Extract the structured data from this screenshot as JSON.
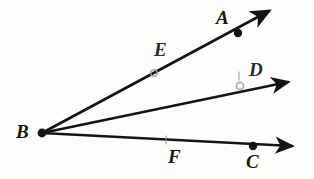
{
  "figure": {
    "type": "geometry-diagram",
    "background_color": "#fdfdfb",
    "ink_color": "#141414",
    "faded_ink_color": "#9a9a9a",
    "width": 314,
    "height": 179,
    "vertex": {
      "name": "B",
      "x": 42,
      "y": 133
    },
    "rays": [
      {
        "name": "ray-BA",
        "from": "B",
        "through": "A",
        "start": {
          "x": 42,
          "y": 133
        },
        "tip": {
          "x": 269,
          "y": 11
        },
        "stroke_width": 2.6
      },
      {
        "name": "ray-BD",
        "from": "B",
        "through": "D",
        "start": {
          "x": 42,
          "y": 133
        },
        "tip": {
          "x": 288,
          "y": 82
        },
        "stroke_width": 2.4
      },
      {
        "name": "ray-BC",
        "from": "B",
        "through": "C",
        "start": {
          "x": 42,
          "y": 133
        },
        "tip": {
          "x": 292,
          "y": 146
        },
        "stroke_width": 2.4
      }
    ],
    "points": [
      {
        "name": "A",
        "label": "A",
        "dot_x": 238,
        "dot_y": 33,
        "dot_r": 4.2,
        "dot_style": "solid",
        "label_x": 216,
        "label_y": 8
      },
      {
        "name": "B",
        "label": "B",
        "dot_x": 42,
        "dot_y": 133,
        "dot_r": 4.4,
        "dot_style": "solid",
        "label_x": 16,
        "label_y": 122
      },
      {
        "name": "C",
        "label": "C",
        "dot_x": 253,
        "dot_y": 146,
        "dot_r": 4.2,
        "dot_style": "solid",
        "label_x": 246,
        "label_y": 152
      },
      {
        "name": "D",
        "label": "D",
        "dot_x": 240,
        "dot_y": 86,
        "dot_r": 3.6,
        "dot_style": "faded",
        "label_x": 249,
        "label_y": 60
      },
      {
        "name": "E",
        "label": "E",
        "dot_x": 154,
        "dot_y": 73,
        "dot_r": 3.2,
        "dot_style": "faded",
        "label_x": 154,
        "label_y": 40
      },
      {
        "name": "F",
        "label": "F",
        "dot_x": 166,
        "dot_y": 140,
        "dot_r": 0,
        "dot_style": "tick",
        "label_x": 168,
        "label_y": 147
      }
    ],
    "tick_marks": [
      {
        "name": "tick-at-F",
        "x": 166,
        "y": 140,
        "height": 9
      },
      {
        "name": "tick-at-D",
        "x": 239,
        "y": 76,
        "height": 9
      }
    ]
  }
}
